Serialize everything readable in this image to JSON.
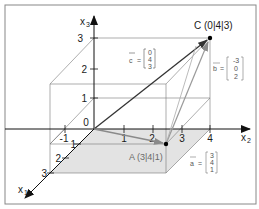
{
  "figure": {
    "type": "3D coordinate system with vectors",
    "axes": {
      "x1": {
        "label": "x",
        "subscript": "1",
        "ticks": [
          "1",
          "2",
          "3"
        ]
      },
      "x2": {
        "label": "x",
        "subscript": "2",
        "ticks": [
          "-1",
          "1",
          "2",
          "3",
          "4"
        ]
      },
      "x3": {
        "label": "x",
        "subscript": "3",
        "ticks": [
          "1",
          "2",
          "3"
        ]
      },
      "origin_label": "0"
    },
    "points": {
      "A": {
        "label": "A (3|4|1)",
        "coords": [
          3,
          4,
          1
        ]
      },
      "C": {
        "label": "C (0|4|3)",
        "coords": [
          0,
          4,
          3
        ]
      }
    },
    "vectors": {
      "a": {
        "name": "a",
        "eq": "=",
        "components": [
          "3",
          "4",
          "1"
        ],
        "color": "#8a8a8a"
      },
      "b": {
        "name": "b",
        "eq": "=",
        "components": [
          "-3",
          "0",
          "2"
        ],
        "color": "#9a9a9a"
      },
      "c": {
        "name": "c",
        "eq": "=",
        "components": [
          "0",
          "4",
          "3"
        ],
        "color": "#222222"
      }
    },
    "colors": {
      "axis": "#111111",
      "box": "#777777",
      "shade": "#e3e3e3",
      "frame": "#888888"
    }
  }
}
